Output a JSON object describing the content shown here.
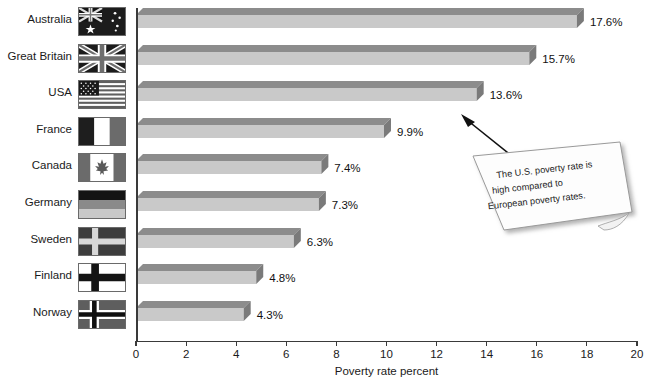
{
  "chart_data": {
    "type": "bar",
    "orientation": "horizontal",
    "title": "",
    "xlabel": "Poverty rate percent",
    "ylabel": "",
    "xlim": [
      0,
      20
    ],
    "xticks": [
      0,
      2,
      4,
      6,
      8,
      10,
      12,
      14,
      16,
      18,
      20
    ],
    "xtick_labels": [
      "0",
      "2",
      "4",
      "6",
      "8",
      "10",
      "12",
      "14",
      "16",
      "18",
      "20"
    ],
    "grid": false,
    "legend": null,
    "categories": [
      "Australia",
      "Great Britain",
      "USA",
      "France",
      "Canada",
      "Germany",
      "Sweden",
      "Finland",
      "Norway"
    ],
    "values": [
      17.6,
      15.7,
      13.6,
      9.9,
      7.4,
      7.3,
      6.3,
      4.8,
      4.3
    ],
    "value_labels": [
      "17.6%",
      "15.7%",
      "13.6%",
      "9.9%",
      "7.4%",
      "7.3%",
      "6.3%",
      "4.8%",
      "4.3%"
    ],
    "annotations": [
      {
        "kind": "sticky-note",
        "text": "The U.S. poverty rate is high compared to European poverty rates.",
        "lines": [
          "The U.S. poverty rate is",
          "high compared to",
          "European poverty rates."
        ],
        "points_to": "USA"
      }
    ],
    "colors": {
      "bar_front": "#c9c9c9",
      "bar_top": "#8c8c8c",
      "bar_side": "#7a7a7a",
      "axis": "#3a3a3a",
      "text": "#111111",
      "note_fill": "#fdfdfd",
      "note_border": "#9a9a9a"
    }
  },
  "axis": {
    "x_title": "Poverty rate percent",
    "ticks": [
      "0",
      "2",
      "4",
      "6",
      "8",
      "10",
      "12",
      "14",
      "16",
      "18",
      "20"
    ]
  },
  "rows": [
    {
      "country": "Australia",
      "value_label": "17.6%",
      "flag": "flag-australia"
    },
    {
      "country": "Great Britain",
      "value_label": "15.7%",
      "flag": "flag-great-britain"
    },
    {
      "country": "USA",
      "value_label": "13.6%",
      "flag": "flag-usa"
    },
    {
      "country": "France",
      "value_label": "9.9%",
      "flag": "flag-france"
    },
    {
      "country": "Canada",
      "value_label": "7.4%",
      "flag": "flag-canada"
    },
    {
      "country": "Germany",
      "value_label": "7.3%",
      "flag": "flag-germany"
    },
    {
      "country": "Sweden",
      "value_label": "6.3%",
      "flag": "flag-sweden"
    },
    {
      "country": "Finland",
      "value_label": "4.8%",
      "flag": "flag-finland"
    },
    {
      "country": "Norway",
      "value_label": "4.3%",
      "flag": "flag-norway"
    }
  ],
  "note": {
    "line1": "The U.S. poverty rate is",
    "line2": "high compared to",
    "line3": "European poverty rates."
  }
}
